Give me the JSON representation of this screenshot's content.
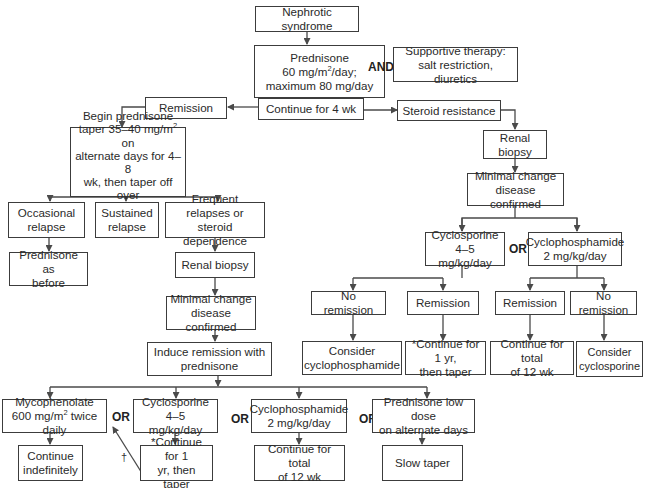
{
  "nodes": {
    "nephrotic": "Nephrotic syndrome",
    "prednisone_init": {
      "l1": "Prednisone",
      "l2a": "60 mg/m",
      "l2sup": "2",
      "l2b": "/day;",
      "l3": "maximum 80 mg/day"
    },
    "supportive": "Supportive therapy:\nsalt restriction, diuretics",
    "continue_4wk": "Continue for 4 wk",
    "remission_top": "Remission",
    "steroid_resistance": "Steroid resistance",
    "taper": {
      "l1": "Begin prednisone",
      "l2a": "taper 35–40 mg/m",
      "l2sup": "2",
      "l2b": " on",
      "l3": "alternate days for 4–8",
      "l4": "wk, then taper off over",
      "l5": "4–6 wk"
    },
    "occasional_relapse": "Occasional\nrelapse",
    "sustained_relapse": "Sustained\nrelapse",
    "frequent_relapses": "Frequent relapses or\nsteroid dependence",
    "prednisone_as_before": "Prednisone as\nbefore",
    "renal_biopsy_left": "Renal biopsy",
    "mcd_left": "Minimal change\ndisease confirmed",
    "induce_remission": "Induce remission with\nprednisone",
    "mycophenolate": {
      "l1": "Mycophenolate",
      "l2a": "600 mg/m",
      "l2sup": "2",
      "l2b": " twice daily"
    },
    "cyclosporine_left": "Cyclosporine 4–5\nmg/kg/day",
    "cyclophosphamide_left": "Cyclophosphamide\n2 mg/kg/day",
    "prednisone_low": "Prednisone low dose\non alternate days",
    "continue_indef": "Continue\nindefinitely",
    "continue_1yr_left": "*Continue for 1\nyr, then taper",
    "continue_12wk_left": "Continue for total\nof 12 wk",
    "slow_taper": "Slow taper",
    "renal_biopsy_right": "Renal biopsy",
    "mcd_right": "Minimal change\ndisease confirmed",
    "cyclosporine_right": "Cyclosporine\n4–5 mg/kg/day",
    "cyclophosphamide_right": "Cyclophosphamide\n2 mg/kg/day",
    "no_remission_1": "No remission",
    "remission_1": "Remission",
    "remission_2": "Remission",
    "no_remission_2": "No remission",
    "consider_cyclophosphamide": "Consider\ncyclophosphamide",
    "continue_1yr_right": "*Continue for 1 yr,\nthen taper",
    "continue_12wk_right": "Continue for total\nof 12 wk",
    "consider_cyclosporine": "Consider\ncyclosporine"
  },
  "operators": {
    "and": "AND",
    "or": "OR"
  },
  "footnote_marks": {
    "dagger": "†"
  },
  "colors": {
    "line": "#4a4a4a",
    "border": "#3c3c3c",
    "text": "#2a2a2a"
  }
}
